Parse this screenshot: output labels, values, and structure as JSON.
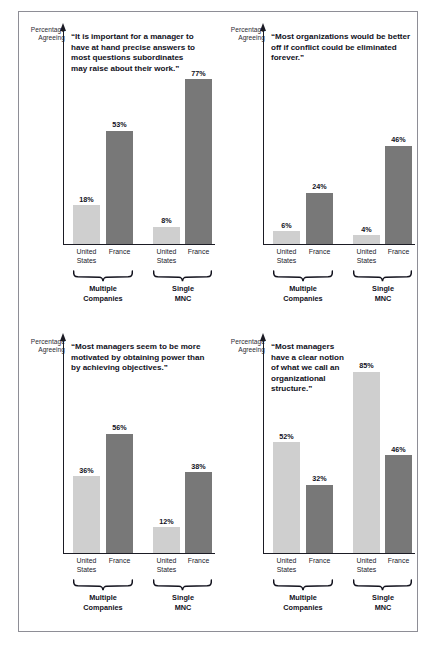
{
  "figure": {
    "axis_label": {
      "line1": "Percentage",
      "line2": "Agreeing"
    },
    "categories": [
      {
        "line1": "United",
        "line2": "States"
      },
      {
        "line1": "France",
        "line2": ""
      },
      {
        "line1": "United",
        "line2": "States"
      },
      {
        "line1": "France",
        "line2": ""
      }
    ],
    "groups": [
      {
        "line1": "Multiple",
        "line2": "Companies"
      },
      {
        "line1": "Single",
        "line2": "MNC"
      }
    ],
    "colors": {
      "light_bar": "#cfcfcf",
      "dark_bar": "#787878",
      "axis": "#1b1b24",
      "frame": "#8e8e96",
      "text": "#11111c"
    }
  },
  "chart_data": [
    {
      "type": "bar",
      "title": "“It is important for a manager to have at hand precise answers to most questions subordinates may raise about their work.”",
      "xlabel": "",
      "ylabel": "Percentage Agreeing",
      "ylim": [
        0,
        100
      ],
      "grid": false,
      "legend": "none",
      "categories": [
        "United States",
        "France",
        "United States",
        "France"
      ],
      "groups": [
        "Multiple Companies",
        "Single MNC"
      ],
      "values": [
        18,
        53,
        8,
        77
      ],
      "labels": [
        "18%",
        "53%",
        "8%",
        "77%"
      ],
      "shades": [
        "light",
        "dark",
        "light",
        "dark"
      ]
    },
    {
      "type": "bar",
      "title": "“Most organizations would be better off if conflict could be eliminated forever.”",
      "xlabel": "",
      "ylabel": "Percentage Agreeing",
      "ylim": [
        0,
        100
      ],
      "grid": false,
      "legend": "none",
      "categories": [
        "United States",
        "France",
        "United States",
        "France"
      ],
      "groups": [
        "Multiple Companies",
        "Single MNC"
      ],
      "values": [
        6,
        24,
        4,
        46
      ],
      "labels": [
        "6%",
        "24%",
        "4%",
        "46%"
      ],
      "shades": [
        "light",
        "dark",
        "light",
        "dark"
      ]
    },
    {
      "type": "bar",
      "title": "“Most managers seem to be more motivated by obtaining power than by achieving objectives.”",
      "xlabel": "",
      "ylabel": "Percentage Agreeing",
      "ylim": [
        0,
        100
      ],
      "grid": false,
      "legend": "none",
      "categories": [
        "United States",
        "France",
        "United States",
        "France"
      ],
      "groups": [
        "Multiple Companies",
        "Single MNC"
      ],
      "values": [
        36,
        56,
        12,
        38
      ],
      "labels": [
        "36%",
        "56%",
        "12%",
        "38%"
      ],
      "shades": [
        "light",
        "dark",
        "light",
        "dark"
      ]
    },
    {
      "type": "bar",
      "title": "“Most managers have a clear notion of what we call an organizational structure.”",
      "xlabel": "",
      "ylabel": "Percentage Agreeing",
      "ylim": [
        0,
        100
      ],
      "grid": false,
      "legend": "none",
      "categories": [
        "United States",
        "France",
        "United States",
        "France"
      ],
      "groups": [
        "Multiple Companies",
        "Single MNC"
      ],
      "values": [
        52,
        32,
        85,
        46
      ],
      "labels": [
        "52%",
        "32%",
        "85%",
        "46%"
      ],
      "shades": [
        "light",
        "dark",
        "light",
        "dark"
      ]
    }
  ]
}
